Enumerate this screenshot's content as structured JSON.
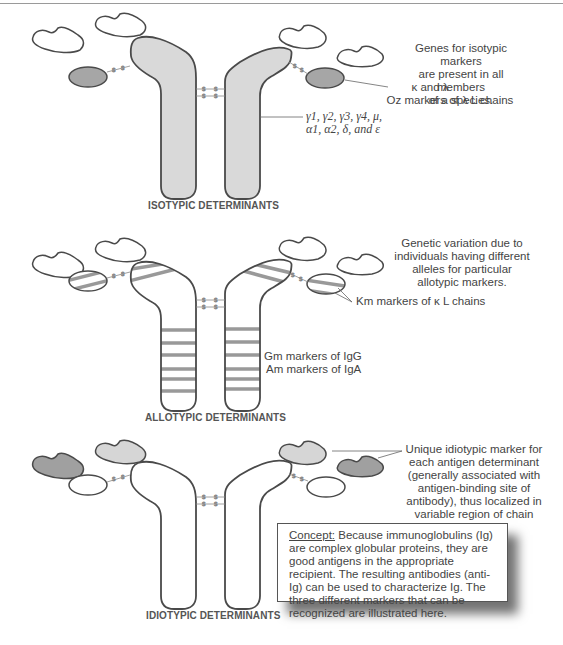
{
  "colors": {
    "outline": "#4a4a4a",
    "isotypic_fill": "#d9d9d9",
    "light_chain_constant_fill": "#a6a6a6",
    "allotypic_band": "#999999",
    "idiotypic_dark": "#a0a0a0",
    "idiotypic_light": "#d6d6d6",
    "bond": "#888888"
  },
  "panels": [
    {
      "id": "isotypic",
      "title": "ISOTYPIC DETERMINANTS",
      "notes": {
        "description": "Genes for isotypic markers are present in all members of a species.",
        "description_lines": [
          "Genes for isotypic markers",
          "are present in all members",
          "of a species."
        ],
        "light_chain_label_lines": [
          "κ and λ",
          "Oz markers of λ  L chains"
        ],
        "heavy_chain_label_lines": [
          "γ1, γ2, γ3, γ4, μ,",
          "α1, α2, δ, and ε"
        ]
      }
    },
    {
      "id": "allotypic",
      "title": "ALLOTYPIC DETERMINANTS",
      "notes": {
        "description": "Genetic variation due to individuals having different alleles for particular allotypic markers.",
        "description_lines": [
          "Genetic variation due to",
          "individuals having different",
          "alleles for particular",
          "allotypic markers."
        ],
        "light_chain_label": "Km markers of  κ  L chains",
        "heavy_chain_label_lines": [
          "Gm markers of IgG",
          "Am markers of IgA"
        ]
      }
    },
    {
      "id": "idiotypic",
      "title": "IDIOTYPIC DETERMINANTS",
      "notes": {
        "description": "Unique idiotypic marker for each antigen determinant (generally associated with antigen-binding site of antibody), thus localized in variable region of chain",
        "description_lines": [
          "Unique idiotypic marker for",
          "each antigen determinant",
          "(generally associated with",
          "antigen-binding site of",
          "antibody), thus localized in",
          "variable region of chain"
        ]
      }
    }
  ],
  "bond_label": "S",
  "concept": {
    "heading": "Concept:",
    "text": " Because immunoglobulins (Ig) are complex globular proteins, they are good antigens in the appropriate recipient.  The resulting antibodies (anti-Ig) can be used to characterize Ig.  The three different markers that can be recognized are illustrated here."
  }
}
